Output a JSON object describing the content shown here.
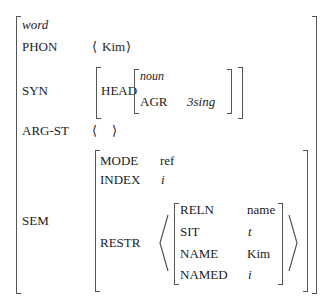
{
  "avm": {
    "type": "word",
    "phon": {
      "label": "PHON",
      "value": "Kim"
    },
    "syn": {
      "label": "SYN",
      "head": {
        "label": "HEAD",
        "type": "noun",
        "agr_label": "AGR",
        "agr_value": "3sing"
      }
    },
    "arg_st": {
      "label": "ARG-ST",
      "value": ""
    },
    "sem": {
      "label": "SEM",
      "mode": {
        "label": "MODE",
        "value": "ref"
      },
      "index": {
        "label": "INDEX",
        "value": "i"
      },
      "restr": {
        "label": "RESTR",
        "items": [
          {
            "label": "RELN",
            "value": "name"
          },
          {
            "label": "SIT",
            "value": "t"
          },
          {
            "label": "NAME",
            "value": "Kim"
          },
          {
            "label": "NAMED",
            "value": "i"
          }
        ]
      }
    }
  }
}
